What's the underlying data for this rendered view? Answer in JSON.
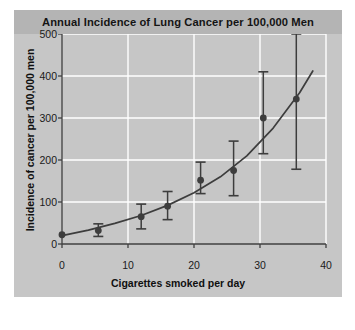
{
  "panel": {
    "title": "Annual Incidence of Lung Cancer per 100,000 Men",
    "background_color": "#c6c6c6",
    "titlebar_color": "#b4b4b4"
  },
  "chart_data": {
    "type": "scatter",
    "title": "Annual Incidence of Lung Cancer per 100,000 Men",
    "xlabel": "Cigarettes smoked per day",
    "ylabel": "Incidence of cancer per 100,000 men",
    "xlim": [
      0,
      40
    ],
    "ylim": [
      0,
      500
    ],
    "xticks": [
      0,
      10,
      20,
      30,
      40
    ],
    "yticks": [
      0,
      100,
      200,
      300,
      400,
      500
    ],
    "xtick_labels": [
      "0",
      "10",
      "20",
      "30",
      "40"
    ],
    "ytick_labels": [
      "0",
      "100",
      "200",
      "300",
      "400",
      "500"
    ],
    "grid": true,
    "grid_color": "#ffffff",
    "legend": "none",
    "marker_color": "#3d3d3d",
    "line_color": "#3d3d3d",
    "errorbar_color": "#3d3d3d",
    "x": [
      0,
      5.5,
      12,
      16,
      21,
      26,
      30.5,
      35.5
    ],
    "y": [
      22,
      32,
      65,
      90,
      152,
      175,
      300,
      345
    ],
    "yerr_low": [
      22,
      18,
      36,
      58,
      120,
      115,
      215,
      178
    ],
    "yerr_high": [
      22,
      48,
      95,
      125,
      195,
      245,
      410,
      500
    ],
    "fit_curve": {
      "description": "fitted increasing exponential trend line",
      "x": [
        0,
        4,
        8,
        12,
        16,
        20,
        24,
        28,
        32,
        36,
        38
      ],
      "y": [
        20,
        33,
        49,
        68,
        92,
        122,
        160,
        210,
        276,
        360,
        412
      ]
    }
  }
}
